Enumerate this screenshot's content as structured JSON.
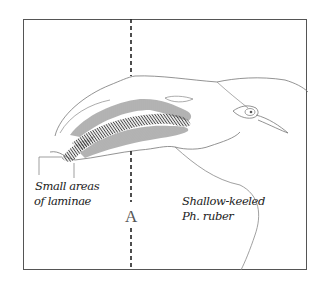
{
  "figure": {
    "section_label": "A",
    "labels": {
      "laminae_line1": "Small areas",
      "laminae_line2": "of laminae",
      "species_line1": "Shallow-keeled",
      "species_line2": "Ph. ruber"
    },
    "colors": {
      "outline": "#777777",
      "frame": "#555555",
      "dashed_line": "#222222",
      "hatching": "#444444",
      "background": "#ffffff"
    }
  }
}
